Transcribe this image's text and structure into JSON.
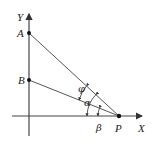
{
  "diagram": {
    "axes": {
      "x_label": "X",
      "y_label": "Y"
    },
    "points": {
      "A": "A",
      "B": "B",
      "P": "P"
    },
    "angles": {
      "phi": "φ",
      "alpha": "α",
      "beta": "β"
    },
    "colors": {
      "line": "#333333",
      "axis": "#444444"
    }
  }
}
